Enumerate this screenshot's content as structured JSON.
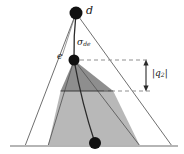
{
  "figure": {
    "name": "geometry-diagram",
    "background": "#ffffff",
    "width": 184,
    "height": 154,
    "colors": {
      "stroke": "#3a3a3a",
      "baseline": "#b5b5b5",
      "dashed": "#9a9a9a",
      "upper_fill": "#8e8e8e",
      "lower_fill": "#b8b8b8",
      "node_fill": "#111111",
      "text": "#1a1a1a"
    },
    "labels": {
      "apex": "d",
      "mid": "e",
      "sigma": "σ",
      "sigma_sub": "de",
      "q_bar_open": "|",
      "q": "q",
      "q_sub": "2",
      "q_bar_close": "|"
    },
    "nodes": [
      {
        "id": "d",
        "label": "d",
        "x": 76,
        "y": 13,
        "r": 6.5
      },
      {
        "id": "e",
        "label": "e",
        "x": 74,
        "y": 60,
        "r": 5.5
      },
      {
        "id": "b",
        "label": "",
        "x": 95,
        "y": 143,
        "r": 6.0
      }
    ],
    "outer_triangle": {
      "apex_x": 76,
      "apex_y": 13,
      "left_x": 25,
      "right_x": 172,
      "base_y": 146
    },
    "inner_triangle": {
      "apex_x": 74,
      "apex_y": 60,
      "left_x": 48,
      "right_x": 140,
      "base_y": 146
    },
    "split_line_y": 91,
    "baseline": {
      "y": 146,
      "x1": 10,
      "x2": 178
    },
    "measure": {
      "x": 146,
      "y_top": 60,
      "y_bottom": 91,
      "label": "|q2|"
    },
    "dashed_lines": [
      {
        "y": 60,
        "x1": 80,
        "x2": 150
      },
      {
        "y": 91,
        "x1": 104,
        "x2": 150
      }
    ],
    "curve": {
      "from": "e",
      "to": "b",
      "description": "curved edge from e to bottom node"
    }
  }
}
